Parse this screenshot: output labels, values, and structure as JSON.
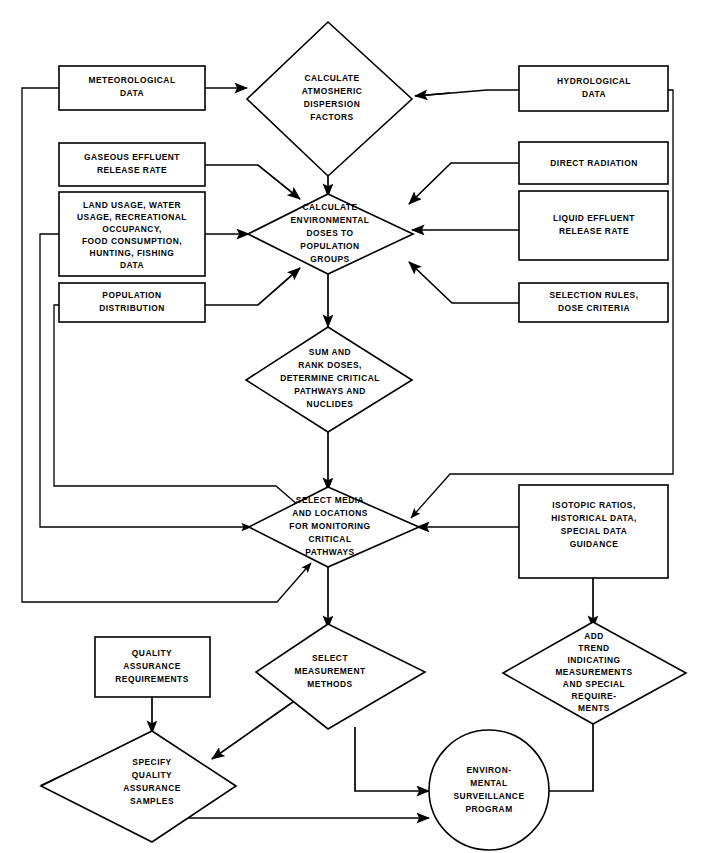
{
  "diagram": {
    "line_color": "#000000",
    "fill_color": "#ffffff",
    "nodes": [
      {
        "id": "meteorological-data",
        "shape": "box",
        "lines": [
          "METEOROLOGICAL",
          "DATA"
        ]
      },
      {
        "id": "calculate-atmospheric",
        "shape": "diamond",
        "lines": [
          "CALCULATE",
          "ATMOSHERIC",
          "DISPERSION",
          "FACTORS"
        ]
      },
      {
        "id": "hydrological-data",
        "shape": "box",
        "lines": [
          "HYDROLOGICAL",
          "DATA"
        ]
      },
      {
        "id": "gaseous-effluent",
        "shape": "box",
        "lines": [
          "GASEOUS EFFLUENT",
          "RELEASE RATE"
        ]
      },
      {
        "id": "direct-radiation",
        "shape": "box",
        "lines": [
          "DIRECT RADIATION"
        ]
      },
      {
        "id": "land-usage-data",
        "shape": "box",
        "lines": [
          "LAND USAGE, WATER",
          "USAGE, RECREATIONAL",
          "OCCUPANCY,",
          "FOOD CONSUMPTION,",
          "HUNTING, FISHING",
          "DATA"
        ]
      },
      {
        "id": "calculate-environmental",
        "shape": "diamond",
        "lines": [
          "CALCULATE",
          "ENVIRONMENTAL",
          "DOSES TO",
          "POPULATION",
          "GROUPS"
        ]
      },
      {
        "id": "liquid-effluent",
        "shape": "box",
        "lines": [
          "LIQUID EFFLUENT",
          "RELEASE RATE"
        ]
      },
      {
        "id": "population-distribution",
        "shape": "box",
        "lines": [
          "POPULATION",
          "DISTRIBUTION"
        ]
      },
      {
        "id": "selection-rules",
        "shape": "box",
        "lines": [
          "SELECTION RULES,",
          "DOSE CRITERIA"
        ]
      },
      {
        "id": "sum-and-rank",
        "shape": "diamond",
        "lines": [
          "SUM AND",
          "RANK DOSES,",
          "DETERMINE CRITICAL",
          "PATHWAYS AND",
          "NUCLIDES"
        ]
      },
      {
        "id": "select-media",
        "shape": "diamond",
        "lines": [
          "SELECT MEDIA",
          "AND LOCATIONS",
          "FOR MONITORING",
          "CRITICAL",
          "PATHWAYS"
        ]
      },
      {
        "id": "isotopic-ratios",
        "shape": "box",
        "lines": [
          "ISOTOPIC RATIOS,",
          "HISTORICAL DATA,",
          "SPECIAL DATA",
          "GUIDANCE"
        ]
      },
      {
        "id": "quality-assurance-req",
        "shape": "box",
        "lines": [
          "QUALITY",
          "ASSURANCE",
          "REQUIREMENTS"
        ]
      },
      {
        "id": "select-measurement",
        "shape": "diamond",
        "lines": [
          "SELECT",
          "MEASUREMENT",
          "METHODS"
        ]
      },
      {
        "id": "add-trend",
        "shape": "diamond",
        "lines": [
          "ADD",
          "TREND",
          "INDICATING",
          "MEASUREMENTS",
          "AND SPECIAL",
          "REQUIRE-",
          "MENTS"
        ]
      },
      {
        "id": "specify-qa-samples",
        "shape": "diamond",
        "lines": [
          "SPECIFY",
          "QUALITY",
          "ASSURANCE",
          "SAMPLES"
        ]
      },
      {
        "id": "environmental-program",
        "shape": "circle",
        "lines": [
          "ENVIRON-",
          "MENTAL",
          "SURVEILLANCE",
          "PROGRAM"
        ]
      }
    ],
    "edges": [
      {
        "id": "met-to-atmospheric",
        "from": "meteorological-data",
        "to": "calculate-atmospheric",
        "arrow": true
      },
      {
        "id": "hydro-to-atmospheric",
        "from": "hydrological-data",
        "to": "calculate-atmospheric",
        "arrow": true
      },
      {
        "id": "atmospheric-to-env",
        "from": "calculate-atmospheric",
        "to": "calculate-environmental",
        "arrow": true
      },
      {
        "id": "gaseous-to-env",
        "from": "gaseous-effluent",
        "to": "calculate-environmental",
        "arrow": true
      },
      {
        "id": "direct-rad-to-env",
        "from": "direct-radiation",
        "to": "calculate-environmental",
        "arrow": true
      },
      {
        "id": "land-usage-to-env",
        "from": "land-usage-data",
        "to": "calculate-environmental",
        "arrow": true
      },
      {
        "id": "liquid-to-env",
        "from": "liquid-effluent",
        "to": "calculate-environmental",
        "arrow": true
      },
      {
        "id": "population-to-env",
        "from": "population-distribution",
        "to": "calculate-environmental",
        "arrow": true
      },
      {
        "id": "selection-rules-to-env",
        "from": "selection-rules",
        "to": "calculate-environmental",
        "arrow": true
      },
      {
        "id": "env-to-sum",
        "from": "calculate-environmental",
        "to": "sum-and-rank",
        "arrow": true
      },
      {
        "id": "sum-to-select-media",
        "from": "sum-and-rank",
        "to": "select-media",
        "arrow": true
      },
      {
        "id": "met-feedback-to-media",
        "from": "meteorological-data",
        "to": "select-media",
        "arrow": true
      },
      {
        "id": "land-feedback-to-media",
        "from": "land-usage-data",
        "to": "select-media",
        "arrow": true
      },
      {
        "id": "population-fb-to-media",
        "from": "population-distribution",
        "to": "select-media",
        "arrow": true
      },
      {
        "id": "hydro-feedback-to-media",
        "from": "hydrological-data",
        "to": "select-media",
        "arrow": true
      },
      {
        "id": "isotopic-to-select-media",
        "from": "isotopic-ratios",
        "to": "select-media",
        "arrow": true
      },
      {
        "id": "media-to-measurement",
        "from": "select-media",
        "to": "select-measurement",
        "arrow": true
      },
      {
        "id": "isotopic-to-add-trend",
        "from": "isotopic-ratios",
        "to": "add-trend",
        "arrow": true
      },
      {
        "id": "qa-req-to-specify",
        "from": "quality-assurance-req",
        "to": "specify-qa-samples",
        "arrow": true
      },
      {
        "id": "measurement-to-specify",
        "from": "select-measurement",
        "to": "specify-qa-samples",
        "arrow": true
      },
      {
        "id": "measurement-to-program",
        "from": "select-measurement",
        "to": "environmental-program",
        "arrow": true
      },
      {
        "id": "specify-to-program",
        "from": "specify-qa-samples",
        "to": "environmental-program",
        "arrow": true
      },
      {
        "id": "add-trend-to-program",
        "from": "add-trend",
        "to": "environmental-program",
        "arrow": true
      }
    ]
  }
}
